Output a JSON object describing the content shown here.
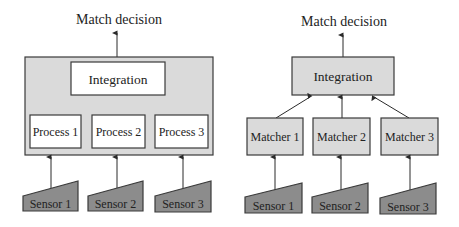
{
  "colors": {
    "light_fill": "#dadada",
    "white_fill": "#ffffff",
    "sensor_fill": "#8c8c8c",
    "stroke": "#3a3a3a"
  },
  "left_diagram": {
    "output_label": "Match decision",
    "integration_label": "Integration",
    "processes": [
      "Process 1",
      "Process 2",
      "Process 3"
    ],
    "sensors": [
      "Sensor 1",
      "Sensor 2",
      "Sensor 3"
    ]
  },
  "right_diagram": {
    "output_label": "Match decision",
    "integration_label": "Integration",
    "matchers": [
      "Matcher 1",
      "Matcher 2",
      "Matcher 3"
    ],
    "sensors": [
      "Sensor 1",
      "Sensor 2",
      "Sensor 3"
    ]
  }
}
